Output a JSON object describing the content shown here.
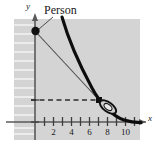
{
  "figure": {
    "name": "person-watching-object-graph",
    "background_color": "#ffffff",
    "panel_color": "#d4d4d4",
    "curve_color": "#000000",
    "line_color": "#4d4d4d",
    "axis_color": "#595959"
  },
  "labels": {
    "person": "Person",
    "y_axis": "y",
    "x_axis": "x"
  },
  "chart_data": {
    "type": "line",
    "title": "",
    "xlabel": "x",
    "ylabel": "y",
    "xlim": [
      0,
      11
    ],
    "ylim": [
      0,
      11
    ],
    "grid": false,
    "xticks": [
      2,
      4,
      6,
      8,
      10
    ],
    "xtick_labels": [
      "2",
      "4",
      "6",
      "8",
      "10"
    ],
    "x_minor_ticks": [
      1,
      3,
      5,
      7,
      9
    ],
    "yticks": [],
    "ytick_labels": [],
    "legend": "none",
    "series": [
      {
        "name": "curve",
        "style": "solid-thick",
        "x": [
          3.2,
          3.8,
          4.4,
          5.0,
          5.6,
          6.2,
          6.8,
          7.4,
          8.0,
          8.6,
          9.2,
          9.8,
          10.4
        ],
        "y": [
          10.6,
          8.9,
          7.4,
          6.1,
          5.0,
          4.0,
          3.2,
          2.5,
          1.9,
          1.4,
          1.0,
          0.6,
          0.35
        ]
      },
      {
        "name": "sight-line",
        "style": "solid-thin",
        "x": [
          0.15,
          6.6
        ],
        "y": [
          9.2,
          2.45
        ]
      },
      {
        "name": "dashed-height-line",
        "style": "dashed",
        "x": [
          0.15,
          6.6
        ],
        "y": [
          2.45,
          2.45
        ]
      }
    ],
    "annotations": [
      {
        "name": "person-point",
        "x": 0.15,
        "y": 9.2,
        "marker": "filled-circle",
        "label": "Person"
      },
      {
        "name": "object-point",
        "x": 6.6,
        "y": 2.45,
        "marker": "filled-square",
        "label": ""
      },
      {
        "name": "object-ellipse",
        "x": 7.5,
        "y": 1.85,
        "marker": "ellipse-outline",
        "label": ""
      }
    ]
  }
}
